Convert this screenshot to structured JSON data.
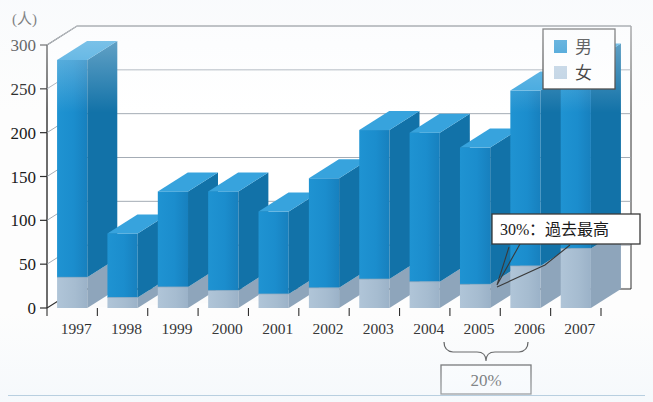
{
  "chart_data": {
    "type": "bar",
    "title": "",
    "subtitle": "",
    "xlabel": "",
    "ylabel": "",
    "unit_label": "(人)",
    "ylim": [
      0,
      300
    ],
    "ytick_step": 50,
    "yticks": [
      "0",
      "50",
      "100",
      "150",
      "200",
      "250",
      "300"
    ],
    "grid": true,
    "stacked": true,
    "three_d": true,
    "legend_position": "top-right",
    "categories": [
      "1997",
      "1998",
      "1999",
      "2000",
      "2001",
      "2002",
      "2003",
      "2004",
      "2005",
      "2006",
      "2007"
    ],
    "series": [
      {
        "name": "女",
        "key": "female",
        "color": "#a9bfd3",
        "side_color": "#8ea5bb",
        "top_color": "#c2d4e3",
        "values": [
          35,
          12,
          24,
          20,
          16,
          23,
          33,
          30,
          27,
          48,
          68
        ]
      },
      {
        "name": "男",
        "key": "male",
        "color": "#1c8fcf",
        "side_color": "#1272a8",
        "top_color": "#37a3dd",
        "values": [
          248,
          73,
          109,
          113,
          94,
          125,
          170,
          170,
          156,
          200,
          212
        ]
      }
    ],
    "totals": [
      283,
      85,
      133,
      133,
      110,
      148,
      203,
      200,
      183,
      248,
      280
    ],
    "annotations": [
      {
        "name": "callout-peak",
        "text": "30%：過去最高",
        "target_category": "2007",
        "box": {
          "x": 492,
          "y": 214,
          "width": 148,
          "height": 30
        }
      },
      {
        "name": "bracket-span",
        "text": "20%",
        "from_category": "2005",
        "to_category": "2006",
        "box": {
          "x": 441,
          "y": 365,
          "width": 90,
          "height": 29
        }
      }
    ]
  },
  "legend": {
    "items": [
      {
        "label": "男",
        "color": "#1c8fcf",
        "name": "legend-item-male"
      },
      {
        "label": "女",
        "color": "#bcd0e2",
        "name": "legend-item-female"
      }
    ]
  },
  "axis": {
    "unit": "(人)",
    "yticks": [
      "300",
      "250",
      "200",
      "150",
      "100",
      "50",
      "0"
    ],
    "xticks": [
      "1997",
      "1998",
      "1999",
      "2000",
      "2001",
      "2002",
      "2003",
      "2004",
      "2005",
      "2006",
      "2007"
    ]
  },
  "callout": {
    "text": "30%：過去最高"
  },
  "bracket": {
    "text": "20%"
  },
  "colors": {
    "male": "#1c8fcf",
    "male_side": "#1272a8",
    "male_top": "#37a3dd",
    "female": "#a9bfd3",
    "female_side": "#8ea5bb",
    "female_top": "#c2d4e3",
    "grid": "#9aa3ad",
    "axis": "#333333",
    "background": "#fdfdfd"
  }
}
